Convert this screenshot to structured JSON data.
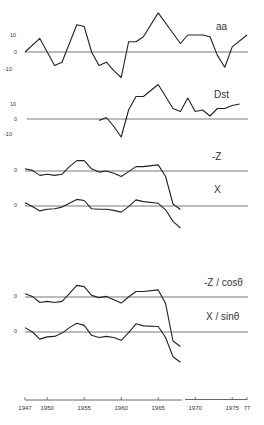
{
  "chart_data": {
    "type": "line",
    "title": "",
    "xlabel": "",
    "x_axis": {
      "ticks": [
        "1947",
        "1950",
        "1955",
        "1960",
        "1965",
        "1970",
        "1975",
        "77"
      ],
      "range": [
        1947,
        1977
      ]
    },
    "panels": [
      {
        "name": "aa",
        "label": "aa",
        "y_ticks": [
          "10",
          "0",
          "-10"
        ],
        "zero_y": 52,
        "scale": 1.7,
        "series": [
          {
            "name": "aa",
            "x": [
              1947,
              1949,
              1950,
              1951,
              1952,
              1954,
              1955,
              1956,
              1957,
              1958,
              1959,
              1960,
              1961,
              1962,
              1963,
              1965,
              1967,
              1968,
              1969,
              1971,
              1972,
              1973,
              1974,
              1975,
              1977
            ],
            "values": [
              0,
              8,
              0,
              -8,
              -6,
              16,
              15,
              0,
              -8,
              -6,
              -11,
              -15,
              6,
              6,
              9,
              23,
              11,
              5,
              10,
              10,
              9,
              -2,
              -9,
              3,
              10
            ]
          }
        ]
      },
      {
        "name": "Dst",
        "label": "Dst",
        "y_ticks": [
          "10",
          "0",
          "-10"
        ],
        "zero_y": 119,
        "scale": 1.5,
        "series": [
          {
            "name": "Dst",
            "x": [
              1957,
              1958,
              1959,
              1960,
              1961,
              1962,
              1963,
              1965,
              1967,
              1968,
              1969,
              1970,
              1971,
              1972,
              1973,
              1974,
              1975,
              1976
            ],
            "values": [
              -1,
              1,
              -5,
              -12,
              6,
              15,
              15,
              23,
              7,
              5,
              14,
              5,
              6,
              2,
              7,
              7,
              9,
              10
            ]
          }
        ]
      },
      {
        "name": "-Z",
        "label": "-Z",
        "y_ticks": [
          "0"
        ],
        "zero_y": 171,
        "series": [
          {
            "name": "-Z",
            "x": [
              1947,
              1948,
              1949,
              1950,
              1951,
              1952,
              1953,
              1954,
              1955,
              1956,
              1957,
              1958,
              1959,
              1960,
              1961,
              1962,
              1963,
              1965,
              1966,
              1967,
              1968
            ],
            "values": [
              4,
              1,
              -8,
              -6,
              -8,
              -6,
              8,
              19,
              19,
              4,
              -2,
              0,
              -4,
              -10,
              -1,
              8,
              8,
              11,
              -10,
              -60,
              -70
            ]
          }
        ]
      },
      {
        "name": "X",
        "label": "X",
        "y_ticks": [
          "0"
        ],
        "zero_y": 206,
        "series": [
          {
            "name": "X",
            "x": [
              1947,
              1948,
              1949,
              1950,
              1951,
              1952,
              1953,
              1954,
              1955,
              1956,
              1957,
              1958,
              1959,
              1960,
              1961,
              1962,
              1963,
              1965,
              1966,
              1967,
              1968
            ],
            "values": [
              6,
              -1,
              -9,
              -6,
              -5,
              -2,
              5,
              12,
              10,
              -5,
              -6,
              -6,
              -8,
              -11,
              -1,
              11,
              8,
              5,
              -7,
              -28,
              -40
            ]
          }
        ]
      },
      {
        "name": "-Z/cos-theta",
        "label": "-Z / cosθ",
        "y_ticks": [
          "0"
        ],
        "zero_y": 297,
        "series": [
          {
            "name": "-Z / cosθ",
            "x": [
              1947,
              1948,
              1949,
              1950,
              1951,
              1952,
              1953,
              1954,
              1955,
              1956,
              1957,
              1958,
              1959,
              1960,
              1961,
              1962,
              1963,
              1965,
              1966,
              1967,
              1968
            ],
            "values": [
              6,
              1,
              -10,
              -8,
              -10,
              -8,
              6,
              21,
              19,
              3,
              -1,
              1,
              -5,
              -11,
              0,
              10,
              10,
              13,
              -12,
              -80,
              -90
            ]
          }
        ]
      },
      {
        "name": "X/sin-theta",
        "label": "X / sinθ",
        "y_ticks": [
          "0"
        ],
        "zero_y": 332,
        "series": [
          {
            "name": "X / sinθ",
            "x": [
              1947,
              1948,
              1949,
              1950,
              1951,
              1952,
              1953,
              1954,
              1955,
              1956,
              1957,
              1958,
              1959,
              1960,
              1961,
              1962,
              1963,
              1965,
              1966,
              1967,
              1968
            ],
            "values": [
              8,
              0,
              -13,
              -9,
              -8,
              -2,
              8,
              16,
              12,
              -6,
              -10,
              -8,
              -10,
              -15,
              -1,
              15,
              11,
              10,
              -10,
              -45,
              -55
            ]
          }
        ]
      }
    ]
  }
}
